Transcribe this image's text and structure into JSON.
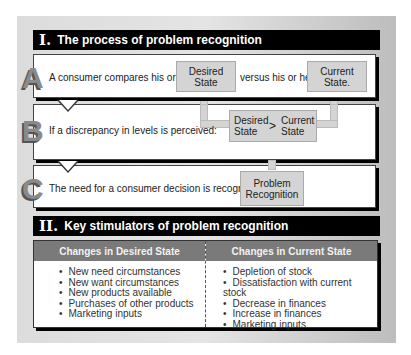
{
  "section1": {
    "numeral": "I.",
    "title": "The process of problem recognition",
    "rows": [
      {
        "letter": "A",
        "text": "A consumer compares his or her",
        "box1": "Desired State",
        "middle": "versus his or her",
        "box2": "Current State."
      },
      {
        "letter": "B",
        "text": "If a discrepancy in levels is perceived:",
        "compare_left_line1": "Desired",
        "compare_left_line2": "State",
        "compare_op": ">",
        "compare_right_line1": "Current",
        "compare_right_line2": "State"
      },
      {
        "letter": "C",
        "text": "The need for a consumer decision is recognized:",
        "result_line1": "Problem",
        "result_line2": "Recognition"
      }
    ]
  },
  "section2": {
    "numeral": "II.",
    "title": "Key stimulators of problem recognition",
    "columns": [
      {
        "header": "Changes in Desired State",
        "items": [
          "New need circumstances",
          "New want circumstances",
          "New products available",
          "Purchases of other products",
          "Marketing inputs"
        ]
      },
      {
        "header": "Changes in Current State",
        "items": [
          "Depletion of stock",
          "Dissatisfaction with current stock",
          "Decrease in finances",
          "Increase in finances",
          "Marketing inputs"
        ]
      }
    ]
  },
  "colors": {
    "header_bg": "#000000",
    "box_fill": "#d4d4d4",
    "table_header_bg": "#7a7a7a",
    "letter_gray": "#8a8a8a"
  }
}
